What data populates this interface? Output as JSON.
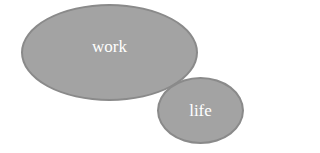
{
  "diagram": {
    "nodes": [
      {
        "id": "work",
        "label": "work",
        "shape": "ellipse",
        "fill": "#a3a3a3",
        "stroke": "#8a8a8a"
      },
      {
        "id": "life",
        "label": "life",
        "shape": "ellipse",
        "fill": "#a3a3a3",
        "stroke": "#8a8a8a"
      }
    ]
  }
}
